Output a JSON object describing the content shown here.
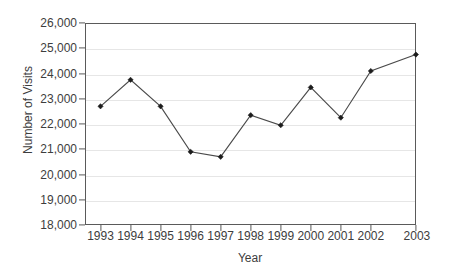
{
  "chart_data": {
    "type": "line",
    "title": "",
    "xlabel": "Year",
    "ylabel": "Number of Visits",
    "categories": [
      "1993",
      "1994",
      "1995",
      "1996",
      "1997",
      "1998",
      "1999",
      "2000",
      "2001",
      "2002",
      "2003"
    ],
    "values": [
      22700,
      23750,
      22700,
      20900,
      20700,
      22350,
      21950,
      23450,
      22250,
      24100,
      24750
    ],
    "series": [
      {
        "name": "Number of Visits",
        "values": [
          22700,
          23750,
          22700,
          20900,
          20700,
          22350,
          21950,
          23450,
          22250,
          24100,
          24750
        ]
      }
    ],
    "ylim": [
      18000,
      26000
    ],
    "ytick_values": [
      18000,
      19000,
      20000,
      21000,
      22000,
      23000,
      24000,
      25000,
      26000
    ],
    "ytick_labels": [
      "18,000",
      "19,000",
      "20,000",
      "21,000",
      "22,000",
      "23,000",
      "24,000",
      "25,000",
      "26,000"
    ],
    "xtick_labels": [
      "1993",
      "1994",
      "1995",
      "1996",
      "1997",
      "1998",
      "1999",
      "2000",
      "2001",
      "2002",
      "2003"
    ],
    "grid": "horizontal",
    "legend": "none",
    "marker": "filled-diamond",
    "line_color": "#4a4a4a",
    "marker_color": "#1c1c1c",
    "grid_color": "#e6e6e6",
    "axis_color": "#5a5a5a",
    "background_color": "#ffffff"
  }
}
